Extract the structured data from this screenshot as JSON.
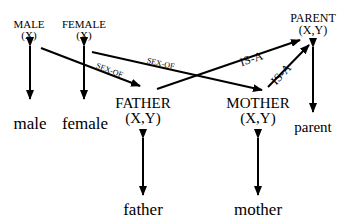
{
  "diagram": {
    "nodes": {
      "male_pred": {
        "name": "MALE",
        "args": "(X)"
      },
      "female_pred": {
        "name": "FEMALE",
        "args": "(X)"
      },
      "parent_pred": {
        "name": "PARENT",
        "args": "(X,Y)"
      },
      "father_pred": {
        "name": "FATHER",
        "args": "(X,Y)"
      },
      "mother_pred": {
        "name": "MOTHER",
        "args": "(X,Y)"
      },
      "male_word": "male",
      "female_word": "female",
      "father_word": "father",
      "mother_word": "mother",
      "parent_word": "parent"
    },
    "edges": [
      {
        "from": "MALE",
        "to": "FATHER",
        "label": "SEX-OF"
      },
      {
        "from": "FEMALE",
        "to": "MOTHER",
        "label": "SEX-OF"
      },
      {
        "from": "FATHER",
        "to": "PARENT",
        "label": "IS-A"
      },
      {
        "from": "MOTHER",
        "to": "PARENT",
        "label": "IS-A"
      },
      {
        "from": "MALE",
        "to": "male",
        "label": ""
      },
      {
        "from": "FEMALE",
        "to": "female",
        "label": ""
      },
      {
        "from": "FATHER",
        "to": "father",
        "label": ""
      },
      {
        "from": "MOTHER",
        "to": "mother",
        "label": ""
      },
      {
        "from": "PARENT",
        "to": "parent",
        "label": ""
      }
    ],
    "edge_labels": {
      "sex_of_1": "SEX-OF",
      "sex_of_2": "SEX-OF",
      "is_a_1": "IS-A",
      "is_a_2": "IS-A"
    }
  }
}
